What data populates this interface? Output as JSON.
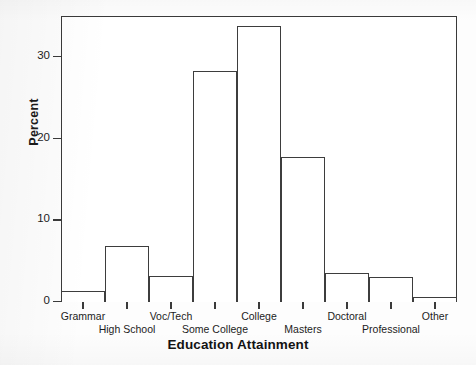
{
  "chart_data": {
    "type": "bar",
    "title": "",
    "xlabel": "Education Attainment",
    "ylabel": "Percent",
    "categories": [
      "Grammar",
      "High School",
      "Voc/Tech",
      "Some College",
      "College",
      "Masters",
      "Doctoral",
      "Professional",
      "Other"
    ],
    "values": [
      1.3,
      6.9,
      3.2,
      28.3,
      33.8,
      17.8,
      3.6,
      3.1,
      0.6
    ],
    "ylim": [
      0,
      35
    ],
    "yticks": [
      0,
      10,
      20,
      30
    ],
    "ytick_labels": [
      "0",
      "10",
      "20",
      "30"
    ],
    "grid": false,
    "legend": false,
    "bar_facecolor": "#ffffff",
    "bar_edgecolor": "#3d3d3d",
    "axis_color": "#3a3a3a",
    "background": "#ffffff"
  },
  "axes": {
    "y_title": "Percent",
    "x_title": "Education Attainment"
  }
}
